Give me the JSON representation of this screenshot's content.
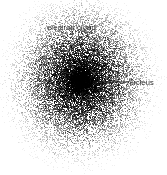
{
  "figure": {
    "type": "scatter-density-diagram",
    "background_color": "#ffffff",
    "width": 167,
    "height": 175
  },
  "annotations": {
    "electron_cloud": {
      "label": "electron cloud",
      "text_color": "#2b2b2b",
      "x": 47,
      "y": 23
    },
    "nucleus": {
      "label": "nucleus",
      "text_color": "#2b2b2b",
      "x": 127,
      "y": 78,
      "leader_line": {
        "color": "#1a1a1a",
        "x1": 93,
        "y1": 82,
        "x2": 125,
        "y2": 82
      }
    }
  },
  "chart_data": {
    "type": "scatter",
    "title": "",
    "xlabel": "",
    "ylabel": "",
    "grid": false,
    "legend": "none",
    "point_color": "#000000",
    "point_size_px": 1,
    "distribution": "radial-gaussian",
    "center": {
      "x": 80,
      "y": 80
    },
    "n_points": 16000,
    "sigma_x": 30,
    "sigma_y": 33,
    "max_radius": 78,
    "nucleus": {
      "center": {
        "x": 80,
        "y": 80
      },
      "radius": 18,
      "n_points": 2600,
      "sigma": 8,
      "color": "#000000"
    },
    "annotations": [
      {
        "text": "electron cloud",
        "x": 47,
        "y": 23
      },
      {
        "text": "nucleus",
        "x": 127,
        "y": 78
      }
    ]
  }
}
